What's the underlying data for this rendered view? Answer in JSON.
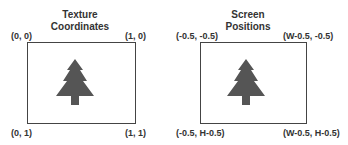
{
  "left": {
    "title_line1": "Texture",
    "title_line2": "Coordinates",
    "top_left": "(0, 0)",
    "top_right": "(1, 0)",
    "bottom_left": "(0, 1)",
    "bottom_right": "(1, 1)"
  },
  "right": {
    "title_line1": "Screen",
    "title_line2": "Positions",
    "top_left": "(-0.5, -0.5)",
    "top_right": "(W-0.5, -0.5)",
    "bottom_left": "(-0.5, H-0.5)",
    "bottom_right": "(W-0.5, H-0.5)"
  },
  "colors": {
    "tree": "#555555",
    "frame": "#444444"
  }
}
